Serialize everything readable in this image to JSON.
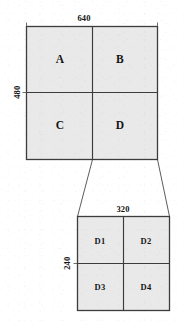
{
  "diagram": {
    "style": {
      "fill_color": "#e9e9e9",
      "stroke_color": "#3c3c3c",
      "background_color": "#ffffff",
      "text_color": "#141414"
    },
    "frames": [
      {
        "id": "full-frame",
        "name": "full-resolution-frame",
        "width_label": "640",
        "height_label": "480",
        "cells": [
          {
            "id": "cell-a",
            "label": "A",
            "row": 0,
            "col": 0
          },
          {
            "id": "cell-b",
            "label": "B",
            "row": 0,
            "col": 1
          },
          {
            "id": "cell-c",
            "label": "C",
            "row": 1,
            "col": 0
          },
          {
            "id": "cell-d",
            "label": "D",
            "row": 1,
            "col": 1
          }
        ]
      },
      {
        "id": "detail-frame",
        "name": "quadrant-d-detail-frame",
        "width_label": "320",
        "height_label": "240",
        "cells": [
          {
            "id": "cell-d1",
            "label": "D1",
            "row": 0,
            "col": 0
          },
          {
            "id": "cell-d2",
            "label": "D2",
            "row": 0,
            "col": 1
          },
          {
            "id": "cell-d3",
            "label": "D3",
            "row": 1,
            "col": 0
          },
          {
            "id": "cell-d4",
            "label": "D4",
            "row": 1,
            "col": 1
          }
        ]
      }
    ],
    "connector": {
      "name": "expansion-connector",
      "from_frame": "full-frame",
      "to_frame": "detail-frame"
    }
  }
}
